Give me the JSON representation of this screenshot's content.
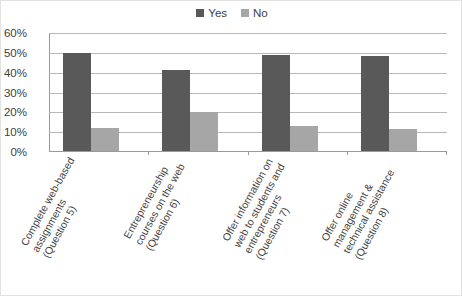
{
  "chart_data": {
    "type": "bar",
    "title": "",
    "subtitle": "",
    "xlabel": "",
    "ylabel": "",
    "ylim": [
      0,
      60
    ],
    "yticks": [
      "0%",
      "10%",
      "20%",
      "30%",
      "40%",
      "50%",
      "60%"
    ],
    "ytick_values": [
      0,
      10,
      20,
      30,
      40,
      50,
      60
    ],
    "grid": true,
    "legend_position": "top-center",
    "categories": [
      "Complete web-based\nassignments\n(Question 5)",
      "Entrepreneurship\ncourses on the web\n(Question 6)",
      "Offer information on\nweb to students and\nentrepreneurs\n(Question 7)",
      "Offer online\nmanagement &\ntechnical assistance\n(Question 8)"
    ],
    "series": [
      {
        "name": "Yes",
        "color": "#595959",
        "values": [
          50,
          41,
          49,
          48.5
        ]
      },
      {
        "name": "No",
        "color": "#a6a6a6",
        "values": [
          11.5,
          20,
          12.5,
          11
        ]
      }
    ]
  },
  "legend": {
    "items": [
      {
        "label": "Yes",
        "color": "#595959"
      },
      {
        "label": "No",
        "color": "#a6a6a6"
      }
    ]
  }
}
